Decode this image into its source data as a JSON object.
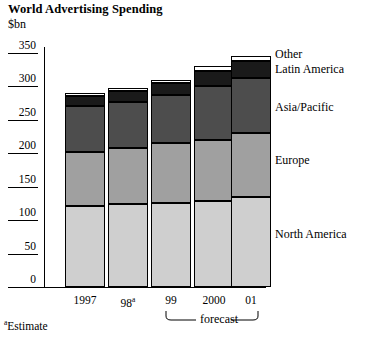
{
  "header": {
    "title": "World Advertising Spending",
    "subtitle": "$bn"
  },
  "footnote": {
    "marker": "a",
    "text": "Estimate"
  },
  "forecast": {
    "label": "forecast"
  },
  "chart_data": {
    "type": "bar",
    "stacked": true,
    "title": "World Advertising Spending",
    "subtitle": "$bn",
    "xlabel": "",
    "ylabel": "$bn",
    "ylim": [
      0,
      350
    ],
    "yticks": [
      0,
      50,
      100,
      150,
      200,
      250,
      300,
      350
    ],
    "ytick_labels": [
      "0",
      "50",
      "100",
      "150",
      "200",
      "250",
      "300",
      "350"
    ],
    "grid": false,
    "legend_position": "right-inline",
    "categories": [
      "1997",
      "98",
      "99",
      "2000",
      "01"
    ],
    "category_labels": [
      "1997",
      "98ᵃ",
      "99",
      "2000",
      "01"
    ],
    "forecast_categories": [
      "99",
      "2000",
      "01"
    ],
    "series": [
      {
        "name": "North America",
        "color": "#cfcfcf",
        "values": [
          121,
          124,
          126,
          129,
          134
        ]
      },
      {
        "name": "Europe",
        "color": "#a0a0a0",
        "values": [
          81,
          84,
          89,
          91,
          96
        ]
      },
      {
        "name": "Asia/Pacific",
        "color": "#4d4d4d",
        "values": [
          68,
          69,
          72,
          80,
          83
        ]
      },
      {
        "name": "Latin America",
        "color": "#1a1a1a",
        "values": [
          16,
          16,
          18,
          23,
          25
        ]
      },
      {
        "name": "Other",
        "color": "#ffffff",
        "values": [
          4,
          4,
          4,
          7,
          7
        ]
      }
    ],
    "totals": [
      290,
      297,
      309,
      330,
      345
    ],
    "annotations": [
      "forecast",
      "ᵃEstimate"
    ]
  },
  "legend": {
    "items": [
      {
        "label": "Other"
      },
      {
        "label": "Latin America"
      },
      {
        "label": "Asia/Pacific"
      },
      {
        "label": "Europe"
      },
      {
        "label": "North America"
      }
    ]
  }
}
